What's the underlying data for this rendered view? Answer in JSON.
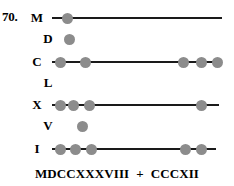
{
  "figure": {
    "problem_number": "70.",
    "caption": {
      "left_numeral": "MDCCXXXVIII",
      "operator": "+",
      "right_numeral": "CCCXII"
    },
    "bead_color": "#8c8c8c",
    "rod_color": "#1a1a1a",
    "rows": [
      {
        "label": "M",
        "label_style": "major",
        "top": 9,
        "has_rod": true,
        "rod_left": 52,
        "rod_right": 222,
        "beads": [
          62
        ]
      },
      {
        "label": "D",
        "label_style": "minor",
        "top": 30,
        "has_rod": false,
        "beads": [
          64
        ]
      },
      {
        "label": "C",
        "label_style": "major",
        "top": 53,
        "has_rod": true,
        "rod_left": 52,
        "rod_right": 222,
        "beads": [
          55,
          80,
          178,
          196,
          212
        ]
      },
      {
        "label": "L",
        "label_style": "minor",
        "top": 74,
        "has_rod": false,
        "beads": []
      },
      {
        "label": "X",
        "label_style": "major",
        "top": 96,
        "has_rod": true,
        "rod_left": 52,
        "rod_right": 219,
        "beads": [
          55,
          68,
          84,
          196
        ]
      },
      {
        "label": "V",
        "label_style": "minor",
        "top": 117,
        "has_rod": false,
        "beads": [
          77
        ]
      },
      {
        "label": "I",
        "label_style": "major",
        "top": 140,
        "has_rod": true,
        "rod_left": 52,
        "rod_right": 216,
        "beads": [
          55,
          70,
          86,
          180,
          196
        ]
      }
    ]
  }
}
